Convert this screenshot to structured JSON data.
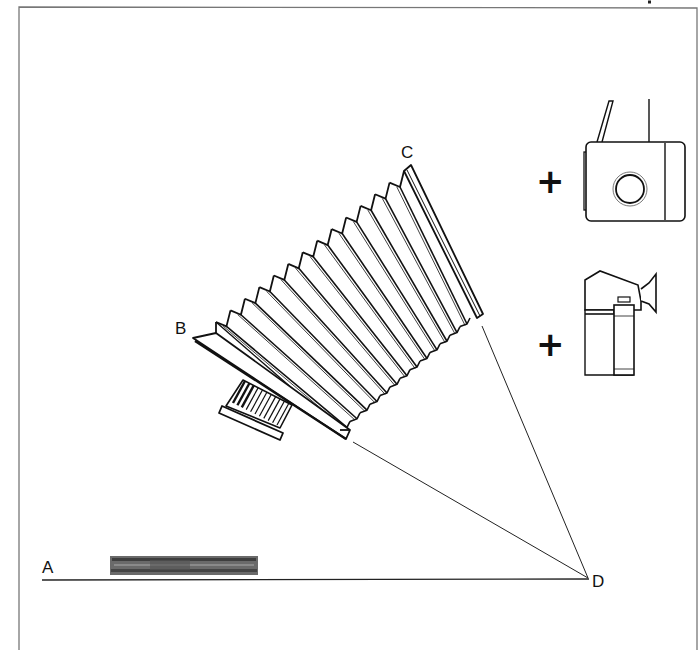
{
  "figure": {
    "labels": {
      "a": "A",
      "b": "B",
      "c": "C",
      "d": "D"
    },
    "plus_signs": [
      "+",
      "+"
    ],
    "attachments": [
      {
        "name": "waist-level-camera-body",
        "symbol": "+"
      },
      {
        "name": "prism-finder-camera-body",
        "symbol": "+"
      }
    ],
    "redacted_block": "obscured text",
    "colors": {
      "ink": "#111111",
      "frame": "#777777",
      "background": "#ffffff",
      "smudge": "#5a5a5a"
    }
  }
}
